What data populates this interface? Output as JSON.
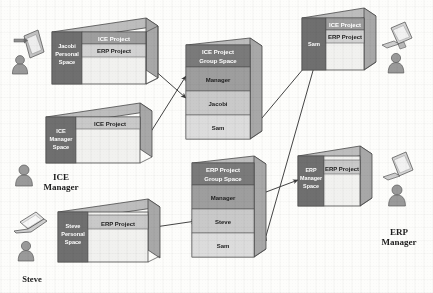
{
  "diagram": {
    "type": "workspace-relationship-diagram",
    "colors": {
      "box_side_dark": "#6f6f6f",
      "box_header_dark": "#7a7a7a",
      "band_mid": "#9e9e9e",
      "band_light": "#c9c9c9",
      "band_lighter": "#dcdcdc",
      "box_empty": "#f1f1ef",
      "top_face": "#bdbdbd",
      "outline": "#4a4a4a",
      "arrow": "#3a3a3a",
      "text_dark": "#1d1d1d",
      "text_light": "#ffffff",
      "icon_fill": "#9a9a9a",
      "page_bg": "#fdfdfb"
    },
    "boxes": [
      {
        "id": "jacobi-personal-space",
        "side_label": "Jacobi\nPersonal\nSpace",
        "side_lines": [
          "Jacobi",
          "Personal",
          "Space"
        ],
        "bands": [
          "ICE Project",
          "ERP Project"
        ]
      },
      {
        "id": "ice-manager-space",
        "side_label": "ICE\nManager\nSpace",
        "side_lines": [
          "ICE",
          "Manager",
          "Space"
        ],
        "bands": [
          "ICE Project"
        ]
      },
      {
        "id": "steve-personal-space",
        "side_label": "Steve\nPersonal\nSpace",
        "side_lines": [
          "Steve",
          "Personal",
          "Space"
        ],
        "bands": [
          "ERP Project"
        ]
      },
      {
        "id": "ice-project-group-space",
        "header_lines": [
          "ICE Project",
          "Group Space"
        ],
        "members": [
          "Manager",
          "Jacobi",
          "Sam"
        ]
      },
      {
        "id": "erp-project-group-space",
        "header_lines": [
          "ERP Project",
          "Group Space"
        ],
        "members": [
          "Manager",
          "Steve",
          "Sam"
        ]
      },
      {
        "id": "sam-personal-space",
        "side_label": "Sam",
        "side_lines": [
          "Sam"
        ],
        "bands": [
          "ICE Project",
          "ERP Project"
        ]
      },
      {
        "id": "erp-manager-space",
        "side_label": "ERP\nManager\nSpace",
        "side_lines": [
          "ERP",
          "Manager",
          "Space"
        ],
        "bands": [
          "ERP Project"
        ]
      }
    ],
    "actors": [
      {
        "id": "jacobi-actor",
        "label": "",
        "device": "tablet-icon"
      },
      {
        "id": "ice-manager-actor",
        "label_lines": [
          "ICE",
          "Manager"
        ],
        "device": "none"
      },
      {
        "id": "steve-actor",
        "label_lines": [
          "Steve"
        ],
        "device": "laptop-icon"
      },
      {
        "id": "sam-actor",
        "label": "",
        "device": "desktop-computer-icon"
      },
      {
        "id": "erp-manager-actor",
        "label_lines": [
          "ERP",
          "Manager"
        ],
        "device": "desktop-computer-icon"
      }
    ],
    "connections": [
      {
        "from": "jacobi-personal-space",
        "to": "ice-project-group-space",
        "style": "double-arrow"
      },
      {
        "from": "ice-manager-space",
        "to": "ice-project-group-space",
        "style": "double-arrow"
      },
      {
        "from": "steve-personal-space",
        "to": "erp-project-group-space",
        "style": "double-arrow"
      },
      {
        "from": "ice-project-group-space",
        "to": "sam-personal-space",
        "style": "double-arrow"
      },
      {
        "from": "erp-project-group-space",
        "to": "sam-personal-space",
        "style": "double-arrow"
      },
      {
        "from": "erp-project-group-space",
        "to": "erp-manager-space",
        "style": "double-arrow"
      }
    ]
  }
}
